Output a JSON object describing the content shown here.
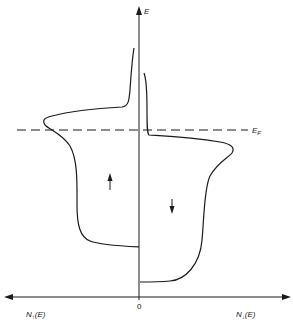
{
  "diagram": {
    "type": "spin-resolved density of states",
    "colors": {
      "line": "#1a1a1a",
      "background": "#ffffff"
    },
    "axes": {
      "vertical_label": "E",
      "left_label": "N",
      "left_label_sub": "↑",
      "left_label_arg": "(E)",
      "right_label": "N",
      "right_label_sub": "↓",
      "right_label_arg": "(E)",
      "origin_label": "0"
    },
    "fermi_level": {
      "label": "E",
      "label_sub": "F",
      "style": "dashed"
    },
    "bands": [
      {
        "name": "spin-up",
        "side": "left",
        "arrow": "up-arrow"
      },
      {
        "name": "spin-down",
        "side": "right",
        "arrow": "down-arrow"
      }
    ]
  }
}
